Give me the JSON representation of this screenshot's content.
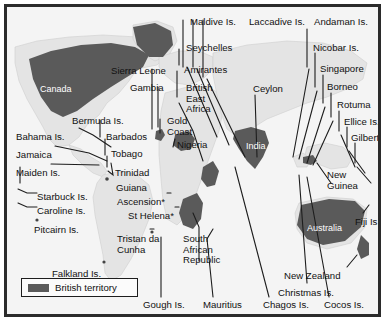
{
  "figure": {
    "kind": "historical-map",
    "frame_color": "#2b2b2b",
    "ocean_color": "#f4f4f4",
    "land_color": "#e2e2e2",
    "territory_color": "#5a5a5a",
    "label_color": "#111111",
    "leader_line_color": "#1d1d1d"
  },
  "legend": {
    "swatch_color": "#5a5a5a",
    "label": "British territory"
  },
  "territory_labels": [
    {
      "name": "canada",
      "text": "Canada",
      "x": 33,
      "y": 77
    },
    {
      "name": "india",
      "text": "India",
      "x": 239,
      "y": 134
    },
    {
      "name": "australia",
      "text": "Australia",
      "x": 300,
      "y": 216
    }
  ],
  "labels": [
    {
      "name": "maldive-is",
      "text": "Maldive Is.",
      "x": 183,
      "y": 10
    },
    {
      "name": "laccadive-is",
      "text": "Laccadive Is.",
      "x": 242,
      "y": 10
    },
    {
      "name": "andaman-is",
      "text": "Andaman Is.",
      "x": 307,
      "y": 10
    },
    {
      "name": "seychelles",
      "text": "Seychelles",
      "x": 179,
      "y": 36
    },
    {
      "name": "nicobar-is",
      "text": "Nicobar Is.",
      "x": 306,
      "y": 36
    },
    {
      "name": "sierra-leone",
      "text": "Sierra Leone",
      "x": 104,
      "y": 59
    },
    {
      "name": "amirantes",
      "text": "Amirantes",
      "x": 177,
      "y": 58
    },
    {
      "name": "singapore",
      "text": "Singapore",
      "x": 313,
      "y": 57
    },
    {
      "name": "gambia",
      "text": "Gambia",
      "x": 123,
      "y": 76
    },
    {
      "name": "british-east-africa",
      "text": "British\nEast\nAfrica",
      "x": 179,
      "y": 76
    },
    {
      "name": "ceylon",
      "text": "Ceylon",
      "x": 246,
      "y": 77
    },
    {
      "name": "borneo",
      "text": "Borneo",
      "x": 320,
      "y": 75
    },
    {
      "name": "bermuda-is",
      "text": "Bermuda Is.",
      "x": 65,
      "y": 109
    },
    {
      "name": "gold-coast",
      "text": "Gold\nCoast",
      "x": 160,
      "y": 109
    },
    {
      "name": "rotuma",
      "text": "Rotuma",
      "x": 330,
      "y": 93
    },
    {
      "name": "ellice-is",
      "text": "Ellice Is.",
      "x": 337,
      "y": 110
    },
    {
      "name": "bahama-is",
      "text": "Bahama Is.",
      "x": 9,
      "y": 125
    },
    {
      "name": "barbados",
      "text": "Barbados",
      "x": 99,
      "y": 125
    },
    {
      "name": "gilbert-is",
      "text": "Gilbert Is.",
      "x": 344,
      "y": 126
    },
    {
      "name": "jamaica",
      "text": "Jamaica",
      "x": 9,
      "y": 143
    },
    {
      "name": "tobago",
      "text": "Tobago",
      "x": 104,
      "y": 142
    },
    {
      "name": "nigeria",
      "text": "Nigeria",
      "x": 170,
      "y": 133
    },
    {
      "name": "maiden-is",
      "text": "Maiden Is.",
      "x": 9,
      "y": 161
    },
    {
      "name": "trinidad",
      "text": "Trinidad",
      "x": 108,
      "y": 161
    },
    {
      "name": "new-guinea",
      "text": "New\nGuinea",
      "x": 320,
      "y": 163
    },
    {
      "name": "guiana",
      "text": "Guiana",
      "x": 109,
      "y": 176
    },
    {
      "name": "starbuck-is",
      "text": "Starbuck Is.",
      "x": 30,
      "y": 185
    },
    {
      "name": "ascension",
      "text": "Ascension*",
      "x": 110,
      "y": 190
    },
    {
      "name": "caroline-is",
      "text": "Caroline Is.",
      "x": 30,
      "y": 199
    },
    {
      "name": "st-helena",
      "text": "St Helena*",
      "x": 121,
      "y": 204
    },
    {
      "name": "fiji-is",
      "text": "Fiji Is.",
      "x": 348,
      "y": 210
    },
    {
      "name": "pitcairn-is",
      "text": "Pitcairn Is.",
      "x": 27,
      "y": 218
    },
    {
      "name": "tristan-da-cunha",
      "text": "Tristan da\nCunha",
      "x": 110,
      "y": 227
    },
    {
      "name": "south-african-republic",
      "text": "South\nAfrican\nRepublic",
      "x": 176,
      "y": 227
    },
    {
      "name": "falkland-is",
      "text": "Falkland Is.",
      "x": 45,
      "y": 262
    },
    {
      "name": "new-zealand",
      "text": "New Zealand",
      "x": 277,
      "y": 264
    },
    {
      "name": "christmas-is",
      "text": "Christmas Is.",
      "x": 271,
      "y": 281
    },
    {
      "name": "goughs-is",
      "text": "Gough Is.",
      "x": 136,
      "y": 298
    },
    {
      "name": "mauritius",
      "text": "Mauritius",
      "x": 196,
      "y": 298
    },
    {
      "name": "chagos-is",
      "text": "Chagos Is.",
      "x": 256,
      "y": 298
    },
    {
      "name": "cocos-is",
      "text": "Cocos Is.",
      "x": 317,
      "y": 298
    }
  ]
}
